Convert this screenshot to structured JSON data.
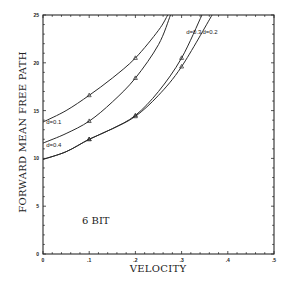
{
  "chart_data": {
    "type": "line",
    "title": "",
    "xlabel": "VELOCITY",
    "ylabel": "FORWARD MEAN FREE PATH",
    "xlim": [
      0,
      0.5
    ],
    "ylim": [
      0,
      25
    ],
    "x_ticks": [
      0,
      0.1,
      0.2,
      0.3,
      0.4,
      0.5
    ],
    "x_tick_labels": [
      "0",
      ".1",
      ".2",
      ".3",
      ".4",
      ".5"
    ],
    "y_ticks": [
      0,
      5,
      10,
      15,
      20,
      25
    ],
    "y_tick_labels": [
      "0",
      "5",
      "10",
      "15",
      "20",
      "25"
    ],
    "grid": false,
    "legend": "none (inline curve labels)",
    "annotations": [
      {
        "text": "6 BIT",
        "x": 0.11,
        "y": 3.6
      }
    ],
    "series": [
      {
        "name": "d=0.1",
        "label_pos": {
          "x": 0.007,
          "y": 13.6
        },
        "x": [
          0,
          0.05,
          0.1,
          0.15,
          0.2,
          0.25,
          0.27
        ],
        "y": [
          13.8,
          15.0,
          16.6,
          18.4,
          20.5,
          23.4,
          25.0
        ],
        "markers": {
          "x": [
            0.1,
            0.2
          ],
          "y": [
            16.6,
            20.5
          ]
        }
      },
      {
        "name": "d=0.4",
        "label_pos": {
          "x": 0.007,
          "y": 11.2
        },
        "x": [
          0,
          0.05,
          0.1,
          0.15,
          0.2,
          0.25,
          0.276
        ],
        "y": [
          11.6,
          12.6,
          13.9,
          15.9,
          18.4,
          21.9,
          25.0
        ],
        "markers": {
          "x": [
            0.1,
            0.2
          ],
          "y": [
            13.9,
            18.4
          ]
        }
      },
      {
        "name": "d=0.3",
        "label_pos": {
          "x": 0.31,
          "y": 23.0
        },
        "x": [
          0,
          0.05,
          0.1,
          0.15,
          0.2,
          0.25,
          0.3,
          0.344
        ],
        "y": [
          9.9,
          10.7,
          12.0,
          13.1,
          14.5,
          17.0,
          20.5,
          25.0
        ],
        "markers": {
          "x": [
            0.1,
            0.2,
            0.3
          ],
          "y": [
            12.0,
            14.5,
            20.5
          ]
        }
      },
      {
        "name": "d=0.2",
        "label_pos": {
          "x": 0.345,
          "y": 23.0
        },
        "x": [
          0,
          0.05,
          0.1,
          0.15,
          0.2,
          0.25,
          0.3,
          0.366
        ],
        "y": [
          9.9,
          10.7,
          12.0,
          13.1,
          14.4,
          16.6,
          19.6,
          25.0
        ],
        "markers": {
          "x": [
            0.1,
            0.2,
            0.3
          ],
          "y": [
            12.0,
            14.4,
            19.6
          ]
        }
      }
    ]
  },
  "labels": {
    "xlabel": "VELOCITY",
    "ylabel": "FORWARD MEAN FREE PATH",
    "annotation": "6 BIT"
  }
}
